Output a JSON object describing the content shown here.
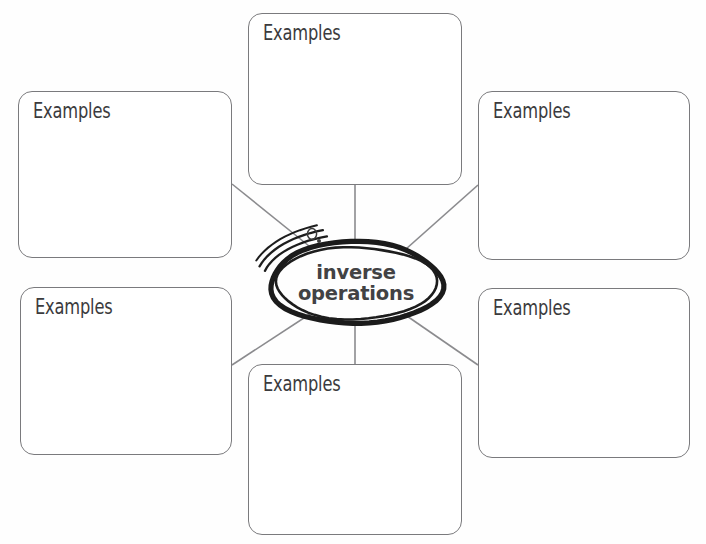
{
  "canvas": {
    "width": 706,
    "height": 544,
    "background_color": "#fefefe"
  },
  "diagram": {
    "type": "concept-web",
    "title_node": {
      "label_line_1": "inverse",
      "label_line_2": "operations",
      "full_label": "inverse operations",
      "shape": "hand-drawn-ellipse",
      "text_color": "#424244",
      "outline_color": "#1b1b1b",
      "center_x": 356,
      "center_y": 283,
      "radius_x": 86,
      "radius_y": 41
    },
    "decoration": {
      "sketch_strokes": "three-motion-lines",
      "artifact_glyph": "small-circle-mark"
    },
    "connector_color": "#8b8b8e",
    "box_border_color": "#7a7a7d",
    "box_fill_color": "#ffffff",
    "boxes": [
      {
        "id": "examples-top-left",
        "label": "Examples",
        "x": 18,
        "y": 91,
        "width": 214,
        "height": 167
      },
      {
        "id": "examples-top-center",
        "label": "Examples",
        "x": 248,
        "y": 13,
        "width": 214,
        "height": 172
      },
      {
        "id": "examples-top-right",
        "label": "Examples",
        "x": 478,
        "y": 91,
        "width": 212,
        "height": 169
      },
      {
        "id": "examples-bottom-left",
        "label": "Examples",
        "x": 20,
        "y": 287,
        "width": 212,
        "height": 168
      },
      {
        "id": "examples-bottom-center",
        "label": "Examples",
        "x": 248,
        "y": 364,
        "width": 214,
        "height": 171
      },
      {
        "id": "examples-bottom-right",
        "label": "Examples",
        "x": 478,
        "y": 288,
        "width": 212,
        "height": 170
      }
    ],
    "connectors": [
      {
        "id": "link-top-left",
        "from": "examples-top-left",
        "x1": 232,
        "y1": 184,
        "x2": 309,
        "y2": 246
      },
      {
        "id": "link-top-center",
        "from": "examples-top-center",
        "x1": 355,
        "y1": 185,
        "x2": 355,
        "y2": 243
      },
      {
        "id": "link-top-right",
        "from": "examples-top-right",
        "x1": 478,
        "y1": 185,
        "x2": 406,
        "y2": 249
      },
      {
        "id": "link-bottom-left",
        "from": "examples-bottom-left",
        "x1": 232,
        "y1": 365,
        "x2": 310,
        "y2": 314
      },
      {
        "id": "link-bottom-center",
        "from": "examples-bottom-center",
        "x1": 355,
        "y1": 364,
        "x2": 355,
        "y2": 324
      },
      {
        "id": "link-bottom-right",
        "from": "examples-bottom-right",
        "x1": 478,
        "y1": 365,
        "x2": 404,
        "y2": 314
      }
    ]
  }
}
